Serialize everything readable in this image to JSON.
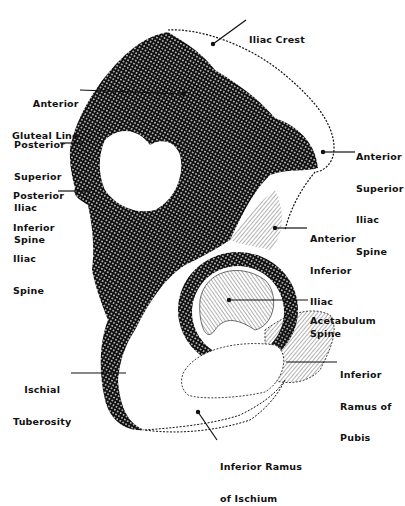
{
  "figure": {
    "colors": {
      "ink": "#111111",
      "background": "#ffffff"
    }
  },
  "labels": {
    "iliac_crest": [
      "Iliac Crest"
    ],
    "anterior_gluteal_line": [
      "Anterior",
      "Gluteal Line"
    ],
    "posterior_superior_iliac_spine": [
      "Posterior",
      "Superior",
      "Iliac",
      "Spine"
    ],
    "posterior_inferior_iliac_spine": [
      "Posterior",
      "Inferior",
      "Iliac",
      "Spine"
    ],
    "anterior_superior_iliac_spine": [
      "Anterior",
      "Superior",
      "Iliac",
      "Spine"
    ],
    "anterior_inferior_iliac_spine": [
      "Anterior",
      "Inferior",
      "Iliac",
      "Spine"
    ],
    "acetabulum": [
      "Acetabulum"
    ],
    "ischial_tuberosity": [
      "Ischial",
      "Tuberosity"
    ],
    "inferior_ramus_of_pubis": [
      "Inferior",
      "Ramus of",
      "Pubis"
    ],
    "inferior_ramus_of_ischium": [
      "Inferior Ramus",
      "of Ischium"
    ]
  }
}
